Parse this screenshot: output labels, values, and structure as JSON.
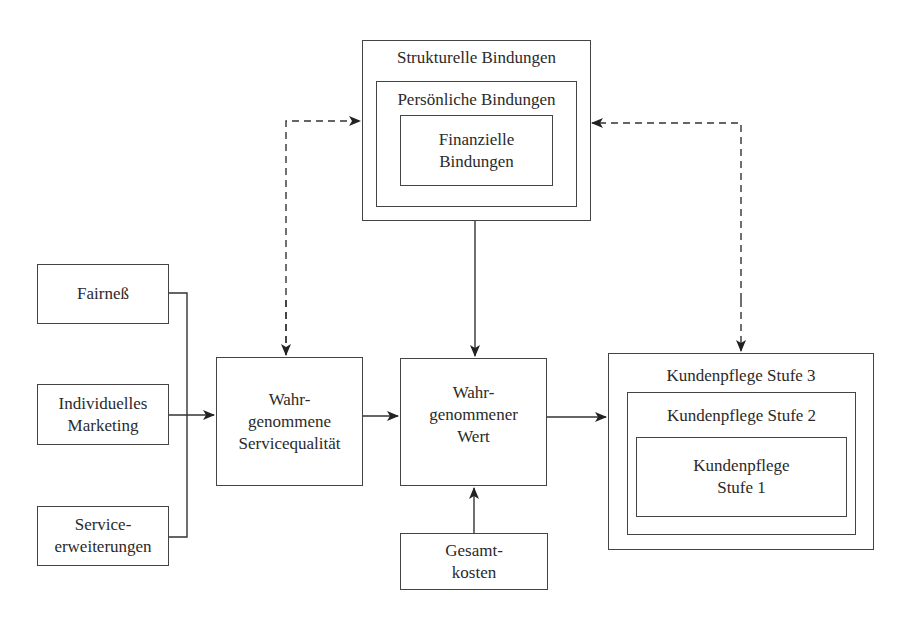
{
  "diagram": {
    "bindings": {
      "outer": "Strukturelle Bindungen",
      "middle": "Persönliche Bindungen",
      "inner": "Finanzielle\nBindungen"
    },
    "inputs": [
      {
        "label": "Fairneß"
      },
      {
        "label": "Individuelles\nMarketing"
      },
      {
        "label": "Service-\nerweiterungen"
      }
    ],
    "service_quality": "Wahr-\ngenommene\nServicequalität",
    "perceived_value": "Wahr-\ngenommener\nWert",
    "total_costs": "Gesamt-\nkosten",
    "customer_care": {
      "level3": "Kundenpflege Stufe 3",
      "level2": "Kundenpflege Stufe 2",
      "level1": "Kundenpflege\nStufe 1"
    },
    "colors": {
      "line": "#333333",
      "text": "#2a2a2a",
      "background": "#ffffff"
    }
  }
}
